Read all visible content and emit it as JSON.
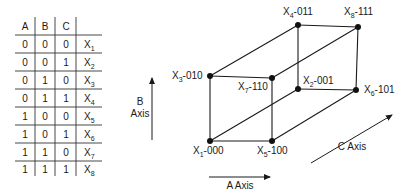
{
  "truth_table": {
    "headers": [
      "A",
      "B",
      "C",
      ""
    ],
    "rows": [
      {
        "a": "0",
        "b": "0",
        "c": "0",
        "x": "X",
        "sub": "1"
      },
      {
        "a": "0",
        "b": "0",
        "c": "1",
        "x": "X",
        "sub": "2"
      },
      {
        "a": "0",
        "b": "1",
        "c": "0",
        "x": "X",
        "sub": "3"
      },
      {
        "a": "0",
        "b": "1",
        "c": "1",
        "x": "X",
        "sub": "4"
      },
      {
        "a": "1",
        "b": "0",
        "c": "0",
        "x": "X",
        "sub": "5"
      },
      {
        "a": "1",
        "b": "0",
        "c": "1",
        "x": "X",
        "sub": "6"
      },
      {
        "a": "1",
        "b": "1",
        "c": "0",
        "x": "X",
        "sub": "7"
      },
      {
        "a": "1",
        "b": "1",
        "c": "1",
        "x": "X",
        "sub": "8"
      }
    ]
  },
  "cube": {
    "vertices": {
      "x1": {
        "name": "X",
        "sub": "1",
        "code": "-000"
      },
      "x2": {
        "name": "X",
        "sub": "2",
        "code": "-001"
      },
      "x3": {
        "name": "X",
        "sub": "3",
        "code": "-010"
      },
      "x4": {
        "name": "X",
        "sub": "4",
        "code": "-011"
      },
      "x5": {
        "name": "X",
        "sub": "5",
        "code": "-100"
      },
      "x6": {
        "name": "X",
        "sub": "6",
        "code": "-101"
      },
      "x7": {
        "name": "X",
        "sub": "7",
        "code": "-110"
      },
      "x8": {
        "name": "X",
        "sub": "8",
        "code": "-111"
      }
    },
    "axes": {
      "a_label": "A Axis",
      "b_label_line1": "B",
      "b_label_line2": "Axis",
      "c_label": "C Axis"
    }
  }
}
